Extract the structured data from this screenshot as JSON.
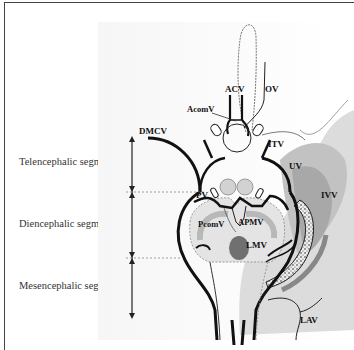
{
  "segments": [
    {
      "label": "Telencephalic segment"
    },
    {
      "label": "Diencephalic segment"
    },
    {
      "label": "Mesencephalic segment"
    }
  ],
  "veins": {
    "acv": "ACV",
    "ov": "OV",
    "acomv": "AcomV",
    "dmcv": "DMCV",
    "itv": "ITV",
    "uv": "UV",
    "ivv": "IVV",
    "pv": "PV",
    "pcomv": "PcomV",
    "apmv": "APMV",
    "lmv": "LMV",
    "lav": "LAV"
  },
  "colors": {
    "vein_line": "#111111",
    "outline_dotted": "#777777",
    "shade_light": "#d8d8d8",
    "shade_mid": "#b8b8b8",
    "shade_dark": "#8a8a8a",
    "lmv_fill": "#777777"
  }
}
